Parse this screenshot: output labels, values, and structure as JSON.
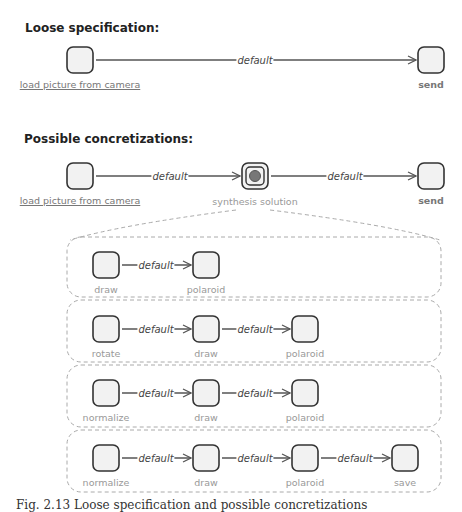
{
  "loose": {
    "title": "Loose specification:",
    "nodes": [
      {
        "label": "load picture from camera",
        "style": "link"
      },
      {
        "label": "send",
        "style": "bold"
      }
    ],
    "edges": [
      {
        "label": "default"
      }
    ]
  },
  "concretizations": {
    "title": "Possible concretizations:",
    "nodes": [
      {
        "label": "load picture from camera",
        "style": "link"
      },
      {
        "label": "synthesis solution",
        "style": "plain"
      },
      {
        "label": "send",
        "style": "bold"
      }
    ],
    "edges": [
      {
        "label": "default"
      },
      {
        "label": "default"
      }
    ],
    "alternatives": [
      {
        "nodes": [
          "draw",
          "polaroid"
        ],
        "edges": [
          "default"
        ]
      },
      {
        "nodes": [
          "rotate",
          "draw",
          "polaroid"
        ],
        "edges": [
          "default",
          "default"
        ]
      },
      {
        "nodes": [
          "normalize",
          "draw",
          "polaroid"
        ],
        "edges": [
          "default",
          "default"
        ]
      },
      {
        "nodes": [
          "normalize",
          "draw",
          "polaroid",
          "save"
        ],
        "edges": [
          "default",
          "default",
          "default"
        ]
      }
    ]
  },
  "caption": {
    "text": "Fig. 2.13 Loose specification and possible concretizations"
  },
  "colors": {
    "node_fill": "#f2f2f2",
    "node_stroke": "#333333",
    "edge": "#555555",
    "dashed": "#aaaaaa",
    "label": "#999999"
  }
}
